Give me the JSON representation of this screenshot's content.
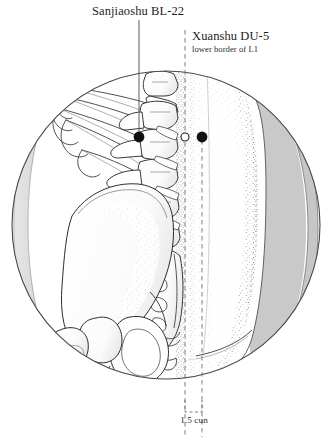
{
  "figure": {
    "type": "anatomical-acupuncture-point-chart",
    "region": "lumbar region, posterior-lateral view",
    "vignette_shape": "circle"
  },
  "labels": {
    "bl22": {
      "name": "Sanjiaoshu BL-22",
      "leader_style": "solid"
    },
    "du5": {
      "name": "Xuanshu DU-5",
      "note": "lower border of L1",
      "leader_style": "dashed"
    },
    "measure": {
      "value": "1.5 cun",
      "bracket_style": "dashed"
    }
  },
  "points": [
    {
      "id": "bl22-point",
      "label": "Sanjiaoshu BL-22",
      "x": 139,
      "y": 137,
      "marker": "filled-dot"
    },
    {
      "id": "du5-point",
      "label": "Xuanshu DU-5",
      "x": 202,
      "y": 137,
      "marker": "filled-dot"
    },
    {
      "id": "midline-marker",
      "label": "spinous process midline",
      "x": 185,
      "y": 137,
      "marker": "hollow-dot"
    }
  ],
  "guides": {
    "midline_x": 185,
    "point_line_x": 202,
    "bracket_from_x": 185,
    "bracket_to_x": 202,
    "bracket_y": 400,
    "bracket_bottom_y": 412
  },
  "colors": {
    "ink": "#1d1d1d",
    "line": "#3a3a3a",
    "shade_gray": "#c9c9c9",
    "shade_gray_light": "#d9d9d9",
    "bone_fill": "#fdfdfd",
    "stipple": "#6f6f6f",
    "background": "#ffffff"
  },
  "anatomy": [
    {
      "part": "ribs",
      "count": 5
    },
    {
      "part": "lumbar-vertebrae",
      "count": 5
    },
    {
      "part": "sacrum",
      "foramina": 4
    },
    {
      "part": "ilium"
    },
    {
      "part": "femur-head-and-greater-trochanter"
    },
    {
      "part": "gluteal-soft-tissue"
    }
  ]
}
